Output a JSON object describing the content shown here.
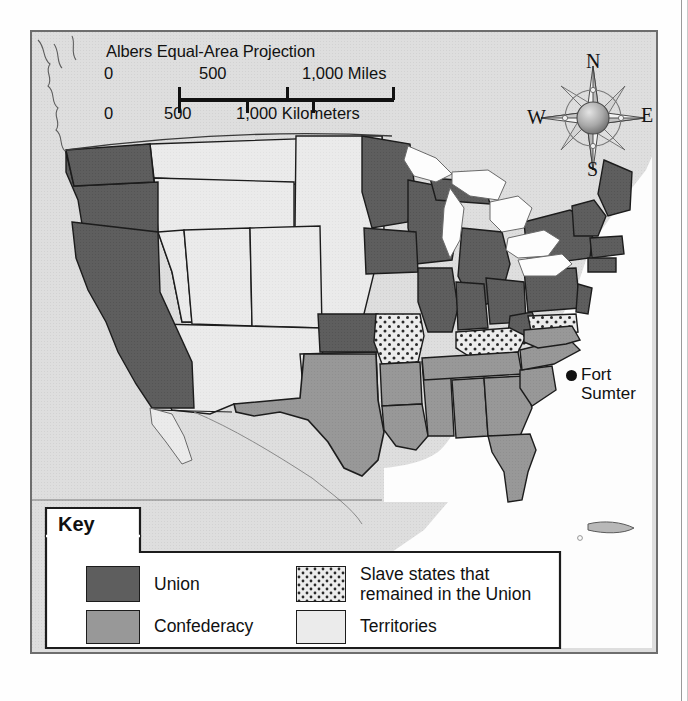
{
  "map": {
    "projection_note": "Albers Equal-Area Projection",
    "scale": {
      "miles": {
        "ticks": [
          "0",
          "500",
          "1,000 Miles"
        ]
      },
      "kilometers": {
        "ticks": [
          "0",
          "500",
          "1,000 Kilometers"
        ]
      }
    },
    "compass": {
      "north": "N",
      "east": "E",
      "south": "S",
      "west": "W"
    },
    "annotations": [
      {
        "name": "fort-sumter",
        "label_line1": "Fort",
        "label_line2": "Sumter"
      }
    ],
    "colors": {
      "union": "#5e5e5e",
      "confederacy": "#969696",
      "slave_union": "#e8e8e8",
      "territories": "#ebebeb",
      "water": "#fdfdfd",
      "background": "#dedede",
      "border": "#1c1c1c"
    }
  },
  "legend": {
    "title": "Key",
    "items": [
      {
        "label": "Union",
        "swatch": "union"
      },
      {
        "label": "Confederacy",
        "swatch": "confederacy"
      },
      {
        "label_line1": "Slave states that",
        "label_line2": "remained in the Union",
        "swatch": "slave_union"
      },
      {
        "label": "Territories",
        "swatch": "territories"
      }
    ]
  }
}
